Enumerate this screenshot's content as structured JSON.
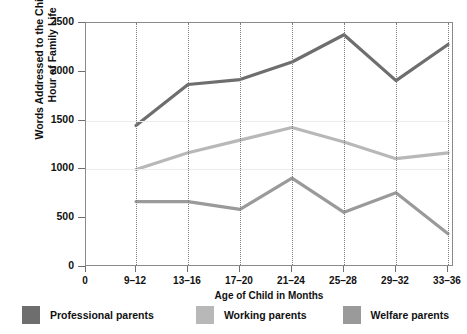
{
  "chart_data": {
    "type": "line",
    "title": "",
    "xlabel": "Age of Child in Months",
    "ylabel": "Words Addressed to the Child per Hour of Family Life",
    "ylabel_line1": "Words Addressed to the Child per",
    "ylabel_line2": "Hour of Family Life",
    "categories": [
      "9–12",
      "13–16",
      "17–20",
      "21–24",
      "25–28",
      "29–32",
      "33–36"
    ],
    "x_origin_label": "0",
    "yticks": [
      0,
      500,
      1000,
      1500,
      2000,
      2500
    ],
    "ytick_labels": [
      "0",
      "500",
      "1000",
      "1500",
      "2000",
      "2500"
    ],
    "ylim": [
      0,
      2500
    ],
    "grid": "vertical-dotted",
    "legend_position": "bottom",
    "series": [
      {
        "name": "Professional parents",
        "color": "#6e6e6e",
        "values": [
          1450,
          1870,
          1920,
          2100,
          2380,
          1910,
          2280
        ]
      },
      {
        "name": "Working parents",
        "color": "#b8b8b8",
        "values": [
          1000,
          1170,
          1300,
          1430,
          1280,
          1110,
          1170
        ]
      },
      {
        "name": "Welfare parents",
        "color": "#9a9a9a",
        "values": [
          670,
          670,
          590,
          910,
          560,
          760,
          340
        ]
      }
    ]
  },
  "legend": {
    "items": [
      {
        "label": "Professional parents",
        "color": "#6e6e6e"
      },
      {
        "label": "Working parents",
        "color": "#b8b8b8"
      },
      {
        "label": "Welfare parents",
        "color": "#9a9a9a"
      }
    ]
  }
}
